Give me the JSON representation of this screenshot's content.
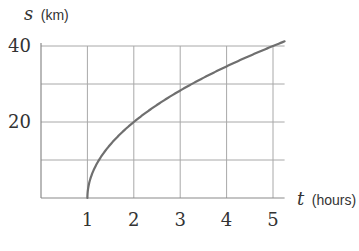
{
  "chart_data": {
    "type": "line",
    "title": "",
    "xlabel_var": "t",
    "xlabel_unit": "(hours)",
    "ylabel_var": "s",
    "ylabel_unit": "(km)",
    "xlim": [
      0,
      5.25
    ],
    "ylim": [
      0,
      40
    ],
    "x_ticks": [
      "1",
      "2",
      "3",
      "4",
      "5"
    ],
    "y_ticks": [
      "20",
      "40"
    ],
    "grid": true,
    "legend": null,
    "series": [
      {
        "name": "s(t)",
        "color": "#6f6f6f",
        "x": [
          1,
          1.0625,
          1.25,
          1.5,
          2,
          2.5,
          3,
          3.5,
          4,
          4.5,
          5,
          5.25
        ],
        "values": [
          0,
          5,
          10,
          14.1,
          20,
          24.5,
          28.3,
          31.6,
          34.6,
          37.4,
          40,
          41.2
        ]
      }
    ]
  },
  "style": {
    "grid_color": "#a8a8a8",
    "axis_color": "#8a8a8a",
    "curve_color": "#6f6f6f",
    "text_color": "#333333"
  }
}
